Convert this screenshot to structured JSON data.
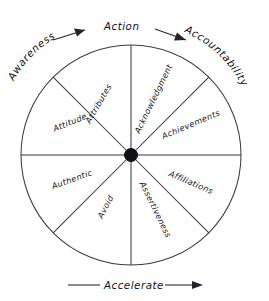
{
  "diagram": {
    "center_hub": {
      "name": "hub"
    },
    "axes": {
      "top": {
        "label": "Action",
        "arrow": "both-outward"
      },
      "bottom": {
        "label": "Accelerate",
        "arrow": "right"
      },
      "upper_left_arc": {
        "label": "Awareness"
      },
      "upper_right_arc": {
        "label": "Accountability"
      }
    },
    "segments": [
      {
        "id": "attributes",
        "label": "Attributes",
        "position": "upper-left-inner"
      },
      {
        "id": "attitude",
        "label": "Attitude",
        "position": "upper-left-outer"
      },
      {
        "id": "acknowledgment",
        "label": "Acknowledgment",
        "position": "upper-right-inner"
      },
      {
        "id": "achievements",
        "label": "Achievements",
        "position": "upper-right-outer"
      },
      {
        "id": "affiliations",
        "label": "Affiliations",
        "position": "lower-right-outer"
      },
      {
        "id": "assertiveness",
        "label": "Assertiveness",
        "position": "lower-right-inner"
      },
      {
        "id": "avoid",
        "label": "Avoid",
        "position": "lower-left-inner"
      },
      {
        "id": "authentic",
        "label": "Authentic",
        "position": "lower-left-outer"
      }
    ],
    "colors": {
      "background": "#ffffff",
      "stroke": "#3b3b42",
      "text": "#101014",
      "hub": "#121216"
    },
    "geometry": {
      "center_x": 131,
      "center_y": 155,
      "radius": 110,
      "segment_count": 8
    }
  }
}
